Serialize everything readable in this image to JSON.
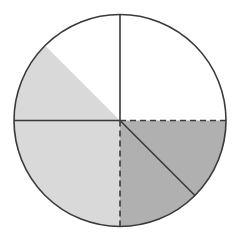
{
  "figure": {
    "type": "pie",
    "background_color": "#ffffff",
    "canvas": {
      "width": 239,
      "height": 245
    }
  },
  "circle": {
    "name": "outer-circle",
    "center_x": 120,
    "center_y": 120.5,
    "radius": 106,
    "stroke_color": "#3a3a3a",
    "stroke_width": 1.6,
    "fill_color": "#ffffff"
  },
  "colors": {
    "dark_gray": "#b0b0b0",
    "light_gray": "#d9d9d9",
    "white": "#ffffff",
    "line": "#3a3a3a"
  },
  "chart_data": {
    "type": "pie",
    "total_degrees": 360,
    "legend_position": "none",
    "grid": false,
    "labels": [
      "unshaded-upper-right",
      "dark-shaded-upper-left",
      "light-shaded-lower"
    ],
    "values": [
      135,
      90,
      135
    ],
    "fractions": [
      "3/8",
      "2/8",
      "3/8"
    ],
    "categories": [
      {
        "name": "unshaded-upper-right",
        "start_angle_deg": 0,
        "end_angle_deg": 135,
        "sweep_deg": 135,
        "fraction": "3/8",
        "fill": "#ffffff",
        "shaded": false
      },
      {
        "name": "dark-shaded-upper-left",
        "start_angle_deg": 270,
        "end_angle_deg": 360,
        "sweep_deg": 90,
        "fraction": "2/8",
        "fill": "#b0b0b0",
        "shaded": true
      },
      {
        "name": "light-shaded-lower",
        "start_angle_deg": 135,
        "end_angle_deg": 270,
        "sweep_deg": 135,
        "fraction": "3/8",
        "fill": "#d9d9d9",
        "shaded": true
      }
    ]
  },
  "radii": [
    {
      "name": "radius-up-solid",
      "direction": "up",
      "angle_deg": 90,
      "style": "solid",
      "from": "center",
      "to": "rim"
    },
    {
      "name": "radius-left-solid",
      "direction": "left",
      "angle_deg": 180,
      "style": "solid",
      "from": "center",
      "to": "rim"
    },
    {
      "name": "radius-diagonal-solid",
      "direction": "lower-right",
      "angle_deg": 315,
      "style": "solid",
      "from": "center",
      "to": "rim"
    },
    {
      "name": "radius-right-dashed",
      "direction": "right",
      "angle_deg": 0,
      "style": "dashed",
      "from": "center",
      "to": "rim"
    },
    {
      "name": "radius-down-dashed",
      "direction": "down",
      "angle_deg": 270,
      "style": "dashed",
      "from": "center",
      "to": "rim"
    }
  ],
  "dash_pattern": "6 4"
}
